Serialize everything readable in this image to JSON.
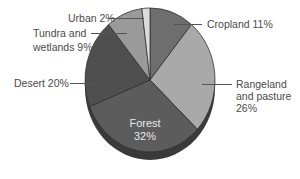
{
  "chart_data": {
    "type": "pie",
    "title": "",
    "start_angle_deg": 0,
    "direction": "clockwise",
    "slices": [
      {
        "label": "Cropland",
        "value": 11,
        "display": "Cropland 11%",
        "color": "#6e6e6e"
      },
      {
        "label": "Rangeland and pasture",
        "value": 26,
        "display": "Rangeland and pasture 26%",
        "color": "#a9a9a9"
      },
      {
        "label": "Forest",
        "value": 32,
        "display": "Forest 32%",
        "color": "#5c5c5c"
      },
      {
        "label": "Desert",
        "value": 20,
        "display": "Desert 20%",
        "color": "#4f4f4f"
      },
      {
        "label": "Tundra and wetlands",
        "value": 9,
        "display": "Tundra and wetlands 9%",
        "color": "#9a9a9a"
      },
      {
        "label": "Urban",
        "value": 2,
        "display": "Urban 2%",
        "color": "#dcdcdc"
      }
    ]
  },
  "labels": {
    "cropland": "Cropland 11%",
    "rangeland_l1": "Rangeland",
    "rangeland_l2": "and pasture",
    "rangeland_l3": "26%",
    "forest_l1": "Forest",
    "forest_l2": "32%",
    "desert": "Desert 20%",
    "tundra_l1": "Tundra and",
    "tundra_l2": "wetlands 9%",
    "urban": "Urban 2%"
  }
}
